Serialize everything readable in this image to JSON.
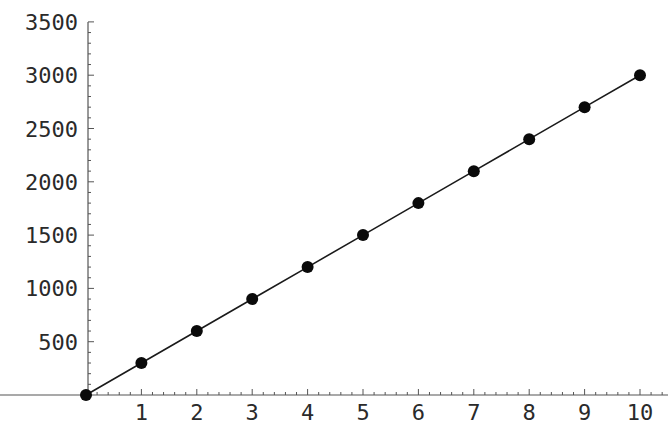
{
  "chart_data": {
    "type": "line",
    "title": "",
    "xlabel": "",
    "ylabel": "",
    "x": [
      0,
      1,
      2,
      3,
      4,
      5,
      6,
      7,
      8,
      9,
      10
    ],
    "series": [
      {
        "name": "data",
        "values": [
          0,
          300,
          600,
          900,
          1200,
          1500,
          1800,
          2100,
          2400,
          2700,
          3000
        ],
        "markers": true,
        "line": true
      }
    ],
    "xticks": [
      1,
      2,
      3,
      4,
      5,
      6,
      7,
      8,
      9,
      10
    ],
    "yticks": [
      500,
      1000,
      1500,
      2000,
      2500,
      3000,
      3500
    ],
    "xlim": [
      -0.9,
      10.5
    ],
    "ylim": [
      0,
      3500
    ],
    "grid": false,
    "legend": null,
    "colors": {
      "line": "#1a1a1a",
      "marker": "#0a0a0a",
      "axis": "#555555",
      "text": "#2a2a2a"
    }
  }
}
